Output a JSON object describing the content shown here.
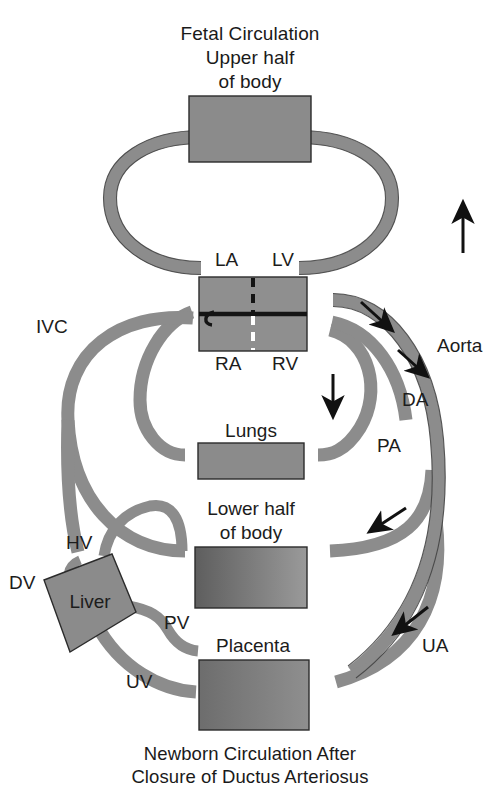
{
  "figure": {
    "title_lines": [
      "Fetal Circulation",
      "Upper half",
      "of body"
    ],
    "footer_lines": [
      "Newborn Circulation After",
      "Closure of Ductus Arteriosus"
    ],
    "title_text": "Fetal Circulation Upper half of body",
    "footer_text": "Newborn Circulation After Closure of Ductus Arteriosus"
  },
  "colors": {
    "vessel": "#8c8c8c",
    "vessel_outline": "#3d3d3d",
    "organ_fill": "#8a8a8a",
    "organ_outline": "#2b2b2b",
    "heart_fill": "#8f8f8f",
    "septum": "#1c1c1c",
    "text": "#1c1c1c",
    "background": "#ffffff"
  },
  "organs": [
    {
      "id": "upper-body",
      "label": "Upper half of body",
      "label_shown": false
    },
    {
      "id": "heart",
      "label": "Heart",
      "label_shown": false
    },
    {
      "id": "lungs",
      "label": "Lungs",
      "label_shown": true
    },
    {
      "id": "lower-body",
      "label": "Lower half of body",
      "label_shown": true,
      "label_lines": [
        "Lower half",
        "of body"
      ]
    },
    {
      "id": "placenta",
      "label": "Placenta",
      "label_shown": true
    },
    {
      "id": "liver",
      "label": "Liver",
      "label_shown": true
    }
  ],
  "heart_chambers": [
    {
      "id": "la",
      "label": "LA",
      "name": "Left atrium"
    },
    {
      "id": "lv",
      "label": "LV",
      "name": "Left ventricle"
    },
    {
      "id": "ra",
      "label": "RA",
      "name": "Right atrium"
    },
    {
      "id": "rv",
      "label": "RV",
      "name": "Right ventricle"
    }
  ],
  "vessel_labels": [
    {
      "id": "ivc",
      "label": "IVC",
      "name": "Inferior vena cava"
    },
    {
      "id": "aorta",
      "label": "Aorta",
      "name": "Aorta"
    },
    {
      "id": "da",
      "label": "DA",
      "name": "Ductus arteriosus"
    },
    {
      "id": "pa",
      "label": "PA",
      "name": "Pulmonary artery"
    },
    {
      "id": "hv",
      "label": "HV",
      "name": "Hepatic vein"
    },
    {
      "id": "dv",
      "label": "DV",
      "name": "Ductus venosus"
    },
    {
      "id": "pv",
      "label": "PV",
      "name": "Portal vein"
    },
    {
      "id": "uv",
      "label": "UV",
      "name": "Umbilical vein"
    },
    {
      "id": "ua",
      "label": "UA",
      "name": "Umbilical artery"
    }
  ],
  "flow_arrows": [
    {
      "id": "arrow-upper-right",
      "direction": "up",
      "near": "upper body return"
    },
    {
      "id": "arrow-aorta-top",
      "direction": "down-right",
      "near": "aortic arch"
    },
    {
      "id": "arrow-da",
      "direction": "down-right",
      "near": "ductus arteriosus"
    },
    {
      "id": "arrow-pa",
      "direction": "down",
      "near": "pulmonary artery"
    },
    {
      "id": "arrow-descending",
      "direction": "down-left",
      "near": "descending aorta"
    },
    {
      "id": "arrow-ua",
      "direction": "down-left",
      "near": "umbilical artery"
    }
  ]
}
